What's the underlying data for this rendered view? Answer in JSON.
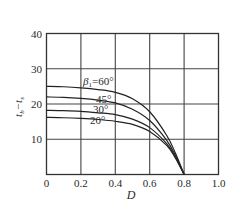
{
  "chart_data": {
    "type": "line",
    "title": "",
    "xlabel": "D",
    "ylabel": "t_b−t_s",
    "xlim": [
      0,
      1.0
    ],
    "ylim": [
      0,
      40
    ],
    "xticks": [
      "0",
      "0.2",
      "0.4",
      "0.6",
      "0.8",
      "1.0"
    ],
    "yticks": [
      "10",
      "20",
      "30",
      "40"
    ],
    "grid": true,
    "legend": "inline labels on curves",
    "series": [
      {
        "name": "β1=60°",
        "label": "β₁=60°",
        "x": [
          0,
          0.1,
          0.2,
          0.3,
          0.4,
          0.5,
          0.6,
          0.7,
          0.75,
          0.8
        ],
        "y": [
          25.0,
          24.9,
          24.6,
          24.1,
          23.3,
          21.5,
          17.8,
          11.0,
          6.0,
          0
        ]
      },
      {
        "name": "β1=45°",
        "label": "45°",
        "x": [
          0,
          0.1,
          0.2,
          0.3,
          0.4,
          0.5,
          0.6,
          0.7,
          0.75,
          0.8
        ],
        "y": [
          22.0,
          21.9,
          21.6,
          21.1,
          20.3,
          18.5,
          15.3,
          9.6,
          5.3,
          0
        ]
      },
      {
        "name": "β1=30°",
        "label": "30°",
        "x": [
          0,
          0.1,
          0.2,
          0.3,
          0.4,
          0.5,
          0.6,
          0.7,
          0.75,
          0.8
        ],
        "y": [
          18.2,
          18.1,
          17.9,
          17.5,
          17.0,
          15.7,
          13.3,
          8.7,
          4.9,
          0
        ]
      },
      {
        "name": "β1=20°",
        "label": "20°",
        "x": [
          0,
          0.1,
          0.2,
          0.3,
          0.4,
          0.5,
          0.6,
          0.7,
          0.75,
          0.8
        ],
        "y": [
          16.2,
          16.1,
          15.9,
          15.6,
          15.1,
          14.2,
          12.2,
          8.2,
          4.6,
          0
        ]
      }
    ]
  },
  "labels": {
    "x_axis": "D",
    "y_axis_main": "t",
    "y_axis_sub1": "b",
    "y_axis_minus": "−t",
    "y_axis_sub2": "s",
    "curve_60": "β",
    "curve_60_sub": "1",
    "curve_60_val": "=60°",
    "curve_45": "45°",
    "curve_30": "30°",
    "curve_20": "20°"
  }
}
